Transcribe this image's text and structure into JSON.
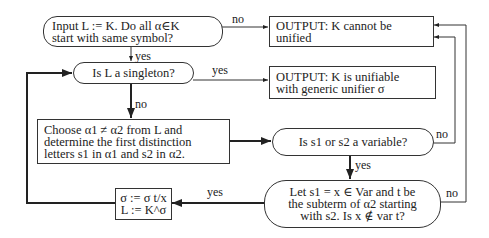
{
  "diagram": {
    "type": "flowchart",
    "nodes": {
      "input": {
        "shape": "rounded",
        "line1": "Input L := K. Do all α∈K",
        "line2": "start with same symbol?"
      },
      "cannot_unify": {
        "shape": "rect",
        "line1": "OUTPUT: K cannot be",
        "line2": "unified"
      },
      "singleton": {
        "shape": "rounded",
        "line1": "Is L a singleton?"
      },
      "unifiable": {
        "shape": "rect",
        "line1": "OUTPUT: K is unifiable",
        "line2": "with generic unifier σ"
      },
      "choose": {
        "shape": "rect",
        "line1": "Choose α1 ≠ α2 from L and",
        "line2": "determine the first distinction",
        "line3": "letters s1 in α1 and s2 in α2."
      },
      "variable": {
        "shape": "rounded",
        "line1": "Is s1 or s2 a variable?"
      },
      "occurs": {
        "shape": "rounded",
        "line1": "Let s1 = x ∈ Var and t be",
        "line2": "the subterm of α2 starting",
        "line3": "with s2. Is x ∉ var t?"
      },
      "update": {
        "shape": "rect",
        "line1": "σ := σ t/x",
        "line2": "L := K^σ"
      }
    },
    "edges": [
      {
        "from": "input",
        "to": "cannot_unify",
        "label": "no"
      },
      {
        "from": "input",
        "to": "singleton",
        "label": "yes"
      },
      {
        "from": "singleton",
        "to": "unifiable",
        "label": "yes"
      },
      {
        "from": "singleton",
        "to": "choose",
        "label": "no"
      },
      {
        "from": "choose",
        "to": "variable",
        "label": ""
      },
      {
        "from": "variable",
        "to": "cannot_unify",
        "label": "no"
      },
      {
        "from": "variable",
        "to": "occurs",
        "label": "yes"
      },
      {
        "from": "occurs",
        "to": "cannot_unify",
        "label": "no"
      },
      {
        "from": "occurs",
        "to": "update",
        "label": "yes"
      },
      {
        "from": "update",
        "to": "singleton",
        "label": ""
      }
    ],
    "labels": {
      "no": "no",
      "yes": "yes"
    }
  }
}
